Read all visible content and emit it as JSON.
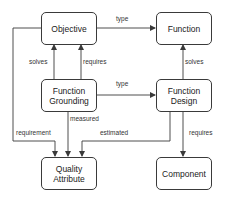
{
  "diagram": {
    "type": "concept-relationship diagram",
    "colors": {
      "stroke": "#3a3a3a",
      "text": "#222222",
      "background": "#ffffff"
    },
    "nodes": {
      "objective": {
        "label": "Objective"
      },
      "function": {
        "label": "Function"
      },
      "function_grounding": {
        "label": "Function\nGrounding"
      },
      "function_design": {
        "label": "Function\nDesign"
      },
      "quality_attribute": {
        "label": "Quality\nAttribute"
      },
      "component": {
        "label": "Component"
      }
    },
    "edges": [
      {
        "id": "objective_type_function",
        "from": "Objective",
        "to": "Function",
        "label": "type"
      },
      {
        "id": "grounding_solves_objective",
        "from": "Function Grounding",
        "to": "Objective",
        "label": "solves"
      },
      {
        "id": "grounding_requires_objective",
        "from": "Function Grounding",
        "to": "Objective",
        "label": "requires"
      },
      {
        "id": "design_solves_function",
        "from": "Function Design",
        "to": "Function",
        "label": "solves"
      },
      {
        "id": "grounding_type_design",
        "from": "Function Grounding",
        "to": "Function Design",
        "label": "type"
      },
      {
        "id": "objective_requirement_quality",
        "from": "Objective",
        "to": "Quality Attribute",
        "label": "requirement"
      },
      {
        "id": "grounding_measured_quality",
        "from": "Function Grounding",
        "to": "Quality Attribute",
        "label": "measured"
      },
      {
        "id": "design_estimated_quality",
        "from": "Function Design",
        "to": "Quality Attribute",
        "label": "estimated"
      },
      {
        "id": "design_requires_component",
        "from": "Function Design",
        "to": "Component",
        "label": "requires"
      }
    ]
  }
}
